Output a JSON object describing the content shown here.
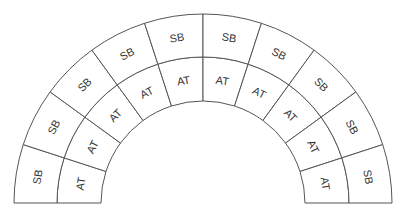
{
  "diagram": {
    "center": {
      "x": 203,
      "y": 203
    },
    "radii": {
      "inner": 102,
      "middle": 146,
      "outer": 189
    },
    "segment_count": 10,
    "outer_ring": {
      "labels": [
        "SB",
        "SB",
        "SB",
        "SB",
        "SB",
        "SB",
        "SB",
        "SB",
        "SB",
        "SB"
      ]
    },
    "inner_ring": {
      "labels": [
        "AT",
        "AT",
        "AT",
        "AT",
        "AT",
        "AT",
        "AT",
        "AT",
        "AT",
        "AT"
      ]
    },
    "colors": {
      "stroke": "#555555",
      "text": "#333333",
      "highlight_text": "#333366"
    }
  }
}
